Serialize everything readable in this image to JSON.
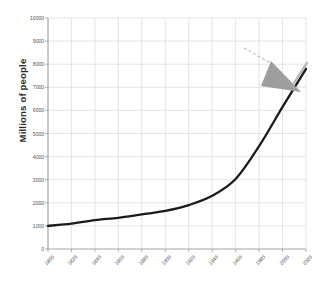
{
  "chart_data": {
    "type": "line",
    "title": "",
    "subtitle": "",
    "xlabel": "",
    "ylabel": "Millions of people",
    "xlim": [
      1800,
      2020
    ],
    "ylim": [
      0,
      10000
    ],
    "grid": true,
    "legend_position": "none",
    "x_tick_labels": [
      "1800",
      "1820",
      "1840",
      "1860",
      "1880",
      "1900",
      "1920",
      "1940",
      "1960",
      "1980",
      "2000",
      "2020"
    ],
    "y_tick_labels": [
      "0",
      "1000",
      "2000",
      "3000",
      "4000",
      "5000",
      "6000",
      "7000",
      "8000",
      "9000",
      "10000"
    ],
    "x": [
      1800,
      1820,
      1840,
      1860,
      1880,
      1900,
      1920,
      1940,
      1960,
      1980,
      2000,
      2020
    ],
    "series": [
      {
        "name": "World population",
        "color": "#1a1a1a",
        "values": [
          1000,
          1100,
          1250,
          1350,
          1500,
          1650,
          1900,
          2300,
          3030,
          4450,
          6150,
          7800
        ]
      }
    ],
    "annotations": [
      {
        "name": "cursor-arrow",
        "type": "arrow-pointer",
        "color": "#9a9a9a",
        "points_to": "curve-end-near-2020"
      },
      {
        "name": "dashed-leader-line",
        "type": "dashed-line",
        "color": "#b0b0b0"
      },
      {
        "name": "curve-highlight-tip",
        "type": "line-segment",
        "color": "#b5b5b5"
      }
    ]
  },
  "colors": {
    "line": "#1a1a1a",
    "grid": "#d9d9d9",
    "axis": "#9a9a9a",
    "tick_text": "#555555",
    "ylabel_text": "#2b2b2b",
    "annotation": "#9a9a9a",
    "background": "#ffffff"
  }
}
